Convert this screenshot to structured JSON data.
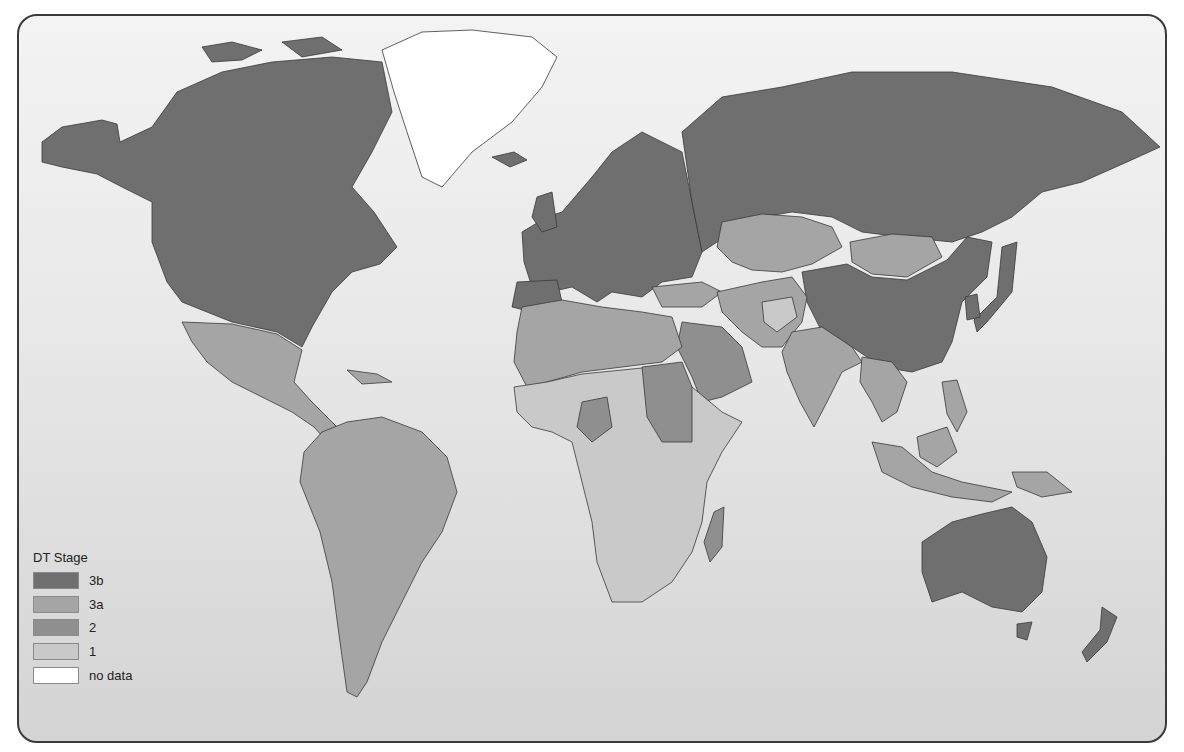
{
  "map": {
    "type": "choropleth world map",
    "title": "",
    "legend": {
      "title": "DT Stage",
      "items": [
        {
          "label": "3b",
          "color": "#6f6f6f"
        },
        {
          "label": "3a",
          "color": "#a5a5a5"
        },
        {
          "label": "2",
          "color": "#8f8f8f"
        },
        {
          "label": "1",
          "color": "#c9c9c9"
        },
        {
          "label": "no data",
          "color": "#ffffff"
        }
      ]
    },
    "colors": {
      "stage_3b": "#6f6f6f",
      "stage_3a": "#a5a5a5",
      "stage_2": "#8f8f8f",
      "stage_1": "#c9c9c9",
      "no_data": "#ffffff",
      "border": "#3a3a3a",
      "background_top": "#f3f3f3",
      "background_bottom": "#d4d4d4"
    },
    "regions": [
      {
        "name": "North America (USA, Canada, Alaska)",
        "stage": "3b"
      },
      {
        "name": "Greenland",
        "stage": "no data"
      },
      {
        "name": "Mexico & Central America",
        "stage": "3a"
      },
      {
        "name": "South America",
        "stage": "3a"
      },
      {
        "name": "Europe",
        "stage": "3b"
      },
      {
        "name": "Russia",
        "stage": "3b"
      },
      {
        "name": "China",
        "stage": "3b"
      },
      {
        "name": "Japan",
        "stage": "3b"
      },
      {
        "name": "South Korea",
        "stage": "3b"
      },
      {
        "name": "Kazakhstan",
        "stage": "3a"
      },
      {
        "name": "Mongolia",
        "stage": "3a"
      },
      {
        "name": "Turkey",
        "stage": "3a"
      },
      {
        "name": "Iran",
        "stage": "3a"
      },
      {
        "name": "India",
        "stage": "3a"
      },
      {
        "name": "Afghanistan",
        "stage": "1"
      },
      {
        "name": "Southeast Asia",
        "stage": "3a"
      },
      {
        "name": "North Africa",
        "stage": "3a"
      },
      {
        "name": "Sudan",
        "stage": "2"
      },
      {
        "name": "Nigeria",
        "stage": "2"
      },
      {
        "name": "Saudi Arabia",
        "stage": "2"
      },
      {
        "name": "Sub-Saharan Africa",
        "stage": "1"
      },
      {
        "name": "Madagascar",
        "stage": "2"
      },
      {
        "name": "Australia",
        "stage": "3b"
      },
      {
        "name": "New Zealand",
        "stage": "3b"
      }
    ]
  }
}
